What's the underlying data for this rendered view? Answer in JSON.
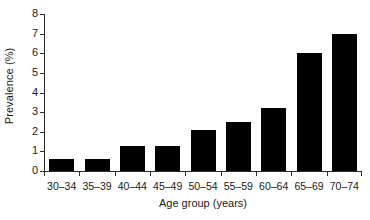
{
  "chart_data": {
    "type": "bar",
    "title": "",
    "xlabel": "Age group (years)",
    "ylabel": "Prevalence (%)",
    "categories": [
      "30–34",
      "35–39",
      "40–44",
      "45–49",
      "50–54",
      "55–59",
      "60–64",
      "65–69",
      "70–74"
    ],
    "values": [
      0.6,
      0.6,
      1.3,
      1.3,
      2.1,
      2.5,
      3.2,
      6.0,
      7.0
    ],
    "ylim": [
      0,
      8
    ],
    "yticks": [
      "0",
      "1",
      "2",
      "3",
      "4",
      "5",
      "6",
      "7",
      "8"
    ],
    "ytick_values": [
      0,
      1,
      2,
      3,
      4,
      5,
      6,
      7,
      8
    ],
    "grid": false,
    "legend": false,
    "bar_color": "#000000",
    "axis_color": "#2b2b2b",
    "background": "#ffffff"
  }
}
